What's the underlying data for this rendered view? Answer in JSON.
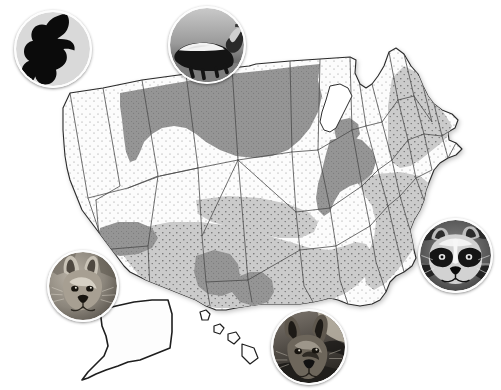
{
  "figure": {
    "kind": "thematic-choropleth-map",
    "region": "United States",
    "background_color": "#ffffff",
    "outline_color": "#2a2a2a",
    "state_border_color": "#4a4a4a"
  },
  "shading": {
    "classes": [
      {
        "id": "low",
        "label": "Low",
        "fill": "#fbfbfb",
        "stipple": true,
        "stipple_color": "#777777"
      },
      {
        "id": "mid",
        "label": "Moderate",
        "fill": "#c9c9c9",
        "stipple": true,
        "stipple_color": "#6a6a6a"
      },
      {
        "id": "high",
        "label": "High",
        "fill": "#949494",
        "stipple": false,
        "stipple_color": "#5a5a5a"
      }
    ]
  },
  "photos": [
    {
      "id": "wolf-silhouette",
      "name": "wolf-howling-silhouette-photo",
      "caption": "Howling wolf silhouette",
      "x": 14,
      "y": 10,
      "size": 78,
      "style": "silhouette",
      "bg": "#d8d8d8",
      "fg": "#0a0a0a"
    },
    {
      "id": "skunk",
      "name": "striped-skunk-photo",
      "caption": "Striped skunk",
      "x": 168,
      "y": 6,
      "size": 78,
      "style": "photo",
      "bg": "#8c8c8c",
      "fg": "#141414"
    },
    {
      "id": "gray-fox",
      "name": "gray-fox-photo",
      "caption": "Gray fox",
      "x": 47,
      "y": 250,
      "size": 72,
      "style": "photo",
      "bg": "#8f8a82",
      "fg": "#2b2620"
    },
    {
      "id": "raccoon",
      "name": "raccoon-photo",
      "caption": "Raccoon",
      "x": 418,
      "y": 218,
      "size": 75,
      "style": "photo",
      "bg": "#6f6f6f",
      "fg": "#111111"
    },
    {
      "id": "coyote",
      "name": "coyote-photo",
      "caption": "Coyote",
      "x": 271,
      "y": 309,
      "size": 76,
      "style": "photo",
      "bg": "#7a7068",
      "fg": "#171310"
    }
  ],
  "map_paths": {
    "usa_outline": "M63,108 L70,93 L103,88 L142,80 L186,74 L232,68 L249,66 L256,64 L290,61 L320,59 L350,57 L356,60 L355,73 L360,84 L366,88 L372,84 L378,76 L384,66 L389,52 L396,48 L404,54 L411,66 L418,74 L423,86 L428,96 L434,104 L442,110 L452,114 L458,120 L455,128 L448,132 L449,140 L456,143 L462,149 L456,155 L448,158 L440,163 L434,170 L430,180 L426,190 L424,200 L420,210 L414,220 L410,230 L412,240 L414,250 L416,258 L412,266 L404,272 L396,276 L390,282 L386,292 L380,300 L372,304 L360,306 L348,304 L338,300 L330,298 L322,300 L313,302 L300,304 L288,304 L274,304 L262,304 L248,306 L236,308 L226,310 L216,310 L206,306 L196,300 L186,296 L176,292 L166,288 L156,284 L146,280 L138,276 L130,272 L124,266 L118,258 L112,250 L106,242 L100,234 L94,226 L88,218 L82,210 L78,200 L74,190 L70,180 L67,168 L65,156 L64,144 L63,130 Z",
    "state_borders": [
      "M70,93 L88,198 L108,258",
      "M103,88 L120,186 L96,200",
      "M142,80 L158,176 L128,188",
      "M186,74 L198,168 L160,176",
      "M232,68 L238,160 L198,168",
      "M290,61 L292,152 L238,160",
      "M320,59 L318,150 L292,152",
      "M88,198 L128,188 L160,176 L198,168",
      "M96,200 L100,250 L148,246 L158,176",
      "M100,250 L104,292 L150,290 L148,246",
      "M198,168 L202,236 L238,160",
      "M202,236 L206,282 L248,280 L238,160",
      "M292,152 L296,212 L238,160",
      "M296,212 L300,250 L248,280",
      "M318,150 L330,208 L296,212",
      "M330,208 L336,246 L300,250",
      "M350,57 L352,130 L318,150",
      "M352,130 L362,186 L330,208",
      "M362,186 L370,226 L336,246",
      "M356,60 L366,126 L352,130",
      "M366,126 L378,170 L362,186",
      "M378,170 L388,206 L370,226",
      "M372,84 L382,122 L366,126",
      "M382,122 L392,160 L378,170",
      "M392,160 L400,196 L388,206",
      "M389,52 L398,100 L382,122",
      "M398,100 L408,140 L392,160",
      "M408,140 L416,178 L400,196",
      "M404,54 L414,96 L398,100",
      "M414,96 L424,134 L408,140",
      "M424,134 L432,170 L416,178",
      "M423,86 L432,122 L414,96",
      "M434,104 L442,136 L424,134",
      "M442,136 L448,158",
      "M448,132 L442,136",
      "M456,143 L448,158",
      "M416,178 L424,200",
      "M400,196 L410,230",
      "M388,206 L396,240 L404,272",
      "M370,226 L376,262 L386,292",
      "M336,246 L340,280 L348,304",
      "M300,250 L304,286 L313,302",
      "M248,280 L252,302",
      "M206,282 L210,306",
      "M150,290 L156,284",
      "M104,292 L112,250"
    ],
    "great_lakes": "M330,86 L340,84 L348,88 L352,96 L348,104 L344,112 L340,120 L336,128 L330,132 L324,130 L320,122 L322,112 L326,100 Z",
    "alaska": "M100,310 L116,306 L134,302 L152,300 L168,300 L172,314 L172,332 L170,348 L160,352 L150,356 L140,360 L128,362 L118,366 L106,370 L96,374 L88,378 L82,380 L88,372 L96,364 L104,356 L108,346 L106,336 L102,326 Z",
    "hawaii": "M200,312 L206,310 L210,314 L208,320 L202,320 Z M214,326 L220,324 L224,328 L220,334 L214,332 Z M228,334 L236,332 L240,338 L234,344 L228,340 Z M242,344 L254,348 L258,358 L250,364 L242,356 Z"
  },
  "overlay_regions": {
    "high": [
      {
        "name": "california-central-valley",
        "path": "M30,143 L40,138 L50,140 L57,150 L60,164 L60,180 L57,196 L52,212 L44,224 L36,230 L28,228 L24,218 L24,204 L26,188 L27,172 L28,157 Z"
      },
      {
        "name": "northern-plains-upper-midwest",
        "path": "M120,93 L170,84 L230,74 L268,70 L300,66 L320,64 L318,80 L322,96 L318,112 L310,128 L300,140 L288,150 L272,156 L254,158 L236,156 L220,150 L206,142 L196,134 L186,128 L174,126 L162,128 L152,134 L144,142 L140,152 L136,160 L130,162 L126,152 L124,138 L122,120 L120,106 Z"
      },
      {
        "name": "ohio-valley-appalachia",
        "path": "M330,140 L348,136 L362,140 L372,150 L376,162 L372,174 L362,182 L350,186 L340,192 L334,202 L330,212 L324,216 L318,210 L316,198 L318,184 L322,170 L326,154 Z"
      },
      {
        "name": "southern-plains-patch",
        "path": "M196,256 L214,250 L230,254 L238,264 L240,276 L250,272 L262,272 L272,280 L274,292 L268,302 L254,306 L240,302 L232,292 L222,296 L208,294 L198,286 L194,272 Z"
      },
      {
        "name": "four-corners-patch",
        "path": "M100,228 L118,222 L138,222 L152,228 L158,238 L152,248 L138,254 L120,256 L106,252 L98,242 Z"
      },
      {
        "name": "lower-michigan-shore",
        "path": "M340,120 L350,118 L358,124 L360,134 L354,142 L344,144 L336,138 L334,128 Z"
      }
    ],
    "mid": [
      {
        "name": "central-southern-band",
        "path": "M116,238 L140,228 L170,222 L200,222 L232,226 L262,234 L290,242 L310,248 L330,250 L344,246 L356,242 L366,244 L372,252 L372,264 L366,276 L356,286 L344,294 L330,300 L314,304 L296,306 L276,306 L256,306 L236,308 L216,308 L198,304 L180,298 L164,292 L150,284 L138,274 L128,262 L120,250 Z"
      },
      {
        "name": "southeast-block",
        "path": "M356,180 L378,174 L400,172 L420,176 L432,186 L436,200 L432,216 L424,232 L414,248 L404,262 L394,274 L384,284 L374,290 L366,284 L364,270 L368,254 L374,238 L376,222 L372,206 L364,194 Z"
      },
      {
        "name": "northeast-block",
        "path": "M392,78 L404,66 L416,72 L426,86 L436,102 L446,116 L452,126 L448,136 L440,144 L430,152 L420,160 L410,166 L400,168 L392,162 L388,150 L388,136 L388,122 L388,106 L390,92 Z"
      },
      {
        "name": "great-plains-transition",
        "path": "M196,200 L228,196 L260,198 L288,204 L308,212 L318,222 L314,232 L300,238 L280,238 L258,234 L234,228 L212,222 L198,214 Z"
      },
      {
        "name": "texas-gulf-lowland",
        "path": "M176,274 L202,268 L228,270 L252,276 L272,286 L286,296 L290,306 L280,312 L262,312 L242,308 L222,304 L202,298 L186,290 L176,282 Z"
      }
    ]
  },
  "accessibility": {
    "alt": "Grayscale map of the United States showing three levels of shading across states, with five circular animal photographs positioned around the map: a howling wolf silhouette, a striped skunk, a gray fox, a raccoon, and a coyote."
  }
}
